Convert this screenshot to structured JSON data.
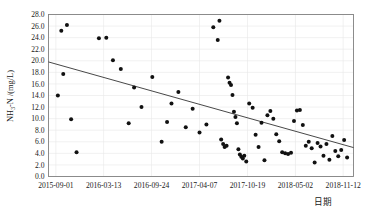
{
  "chart_data": {
    "type": "scatter",
    "title": "",
    "xlabel": "日期",
    "ylabel": "NH3-N /(mg/L)",
    "ylabel_parts": {
      "prefix": "NH",
      "subscript": "3",
      "suffix": "-N /(mg/L)"
    },
    "ylim": [
      0.0,
      28.0
    ],
    "ytick_step": 2.0,
    "yticks": [
      "0.0",
      "2.0",
      "4.0",
      "6.0",
      "8.0",
      "10.0",
      "12.0",
      "14.0",
      "16.0",
      "18.0",
      "20.0",
      "22.0",
      "24.0",
      "26.0",
      "28.0"
    ],
    "ytick_values": [
      0,
      2,
      4,
      6,
      8,
      10,
      12,
      14,
      16,
      18,
      20,
      22,
      24,
      26,
      28
    ],
    "xticks": [
      "2015-09-01",
      "2016-03-13",
      "2016-09-24",
      "2017-04-07",
      "2017-10-19",
      "2018-05-02",
      "2018-11-12"
    ],
    "xtick_days": [
      0,
      194,
      389,
      584,
      779,
      974,
      1168
    ],
    "xlim_days": [
      -30,
      1210
    ],
    "grid": true,
    "grid_color": "#e8e8e8",
    "frame_color": "#808080",
    "marker_color": "#111111",
    "marker_size": 2.0,
    "legend": null,
    "series": [
      {
        "name": "NH3-N measurements",
        "points": [
          {
            "x": 8,
            "y": 14.0
          },
          {
            "x": 22,
            "y": 25.2
          },
          {
            "x": 45,
            "y": 26.2
          },
          {
            "x": 30,
            "y": 17.7
          },
          {
            "x": 62,
            "y": 9.9
          },
          {
            "x": 84,
            "y": 4.2
          },
          {
            "x": 175,
            "y": 23.9
          },
          {
            "x": 205,
            "y": 24.0
          },
          {
            "x": 232,
            "y": 20.1
          },
          {
            "x": 264,
            "y": 18.6
          },
          {
            "x": 296,
            "y": 9.2
          },
          {
            "x": 318,
            "y": 15.4
          },
          {
            "x": 348,
            "y": 12.0
          },
          {
            "x": 392,
            "y": 17.2
          },
          {
            "x": 430,
            "y": 6.0
          },
          {
            "x": 452,
            "y": 9.4
          },
          {
            "x": 470,
            "y": 12.6
          },
          {
            "x": 498,
            "y": 14.6
          },
          {
            "x": 528,
            "y": 8.5
          },
          {
            "x": 556,
            "y": 11.7
          },
          {
            "x": 584,
            "y": 7.6
          },
          {
            "x": 612,
            "y": 9.0
          },
          {
            "x": 640,
            "y": 25.8
          },
          {
            "x": 658,
            "y": 23.6
          },
          {
            "x": 665,
            "y": 26.9
          },
          {
            "x": 672,
            "y": 6.4
          },
          {
            "x": 680,
            "y": 5.6
          },
          {
            "x": 686,
            "y": 5.1
          },
          {
            "x": 694,
            "y": 5.3
          },
          {
            "x": 700,
            "y": 17.1
          },
          {
            "x": 706,
            "y": 16.2
          },
          {
            "x": 712,
            "y": 15.8
          },
          {
            "x": 718,
            "y": 14.1
          },
          {
            "x": 724,
            "y": 11.2
          },
          {
            "x": 730,
            "y": 10.3
          },
          {
            "x": 736,
            "y": 9.2
          },
          {
            "x": 742,
            "y": 4.7
          },
          {
            "x": 748,
            "y": 3.8
          },
          {
            "x": 754,
            "y": 3.4
          },
          {
            "x": 760,
            "y": 3.1
          },
          {
            "x": 766,
            "y": 3.6
          },
          {
            "x": 774,
            "y": 2.6
          },
          {
            "x": 786,
            "y": 12.6
          },
          {
            "x": 800,
            "y": 11.9
          },
          {
            "x": 812,
            "y": 7.2
          },
          {
            "x": 824,
            "y": 5.1
          },
          {
            "x": 836,
            "y": 9.3
          },
          {
            "x": 848,
            "y": 2.8
          },
          {
            "x": 860,
            "y": 10.6
          },
          {
            "x": 872,
            "y": 11.3
          },
          {
            "x": 884,
            "y": 10.0
          },
          {
            "x": 896,
            "y": 7.3
          },
          {
            "x": 908,
            "y": 6.1
          },
          {
            "x": 920,
            "y": 4.2
          },
          {
            "x": 932,
            "y": 4.0
          },
          {
            "x": 944,
            "y": 3.9
          },
          {
            "x": 956,
            "y": 4.1
          },
          {
            "x": 968,
            "y": 9.6
          },
          {
            "x": 980,
            "y": 11.4
          },
          {
            "x": 992,
            "y": 11.5
          },
          {
            "x": 1004,
            "y": 8.9
          },
          {
            "x": 1016,
            "y": 5.3
          },
          {
            "x": 1028,
            "y": 6.0
          },
          {
            "x": 1040,
            "y": 4.9
          },
          {
            "x": 1052,
            "y": 2.4
          },
          {
            "x": 1064,
            "y": 5.8
          },
          {
            "x": 1076,
            "y": 5.2
          },
          {
            "x": 1088,
            "y": 3.6
          },
          {
            "x": 1100,
            "y": 5.6
          },
          {
            "x": 1112,
            "y": 2.9
          },
          {
            "x": 1124,
            "y": 7.0
          },
          {
            "x": 1136,
            "y": 4.4
          },
          {
            "x": 1148,
            "y": 3.5
          },
          {
            "x": 1160,
            "y": 4.6
          },
          {
            "x": 1172,
            "y": 6.3
          },
          {
            "x": 1184,
            "y": 3.3
          }
        ]
      }
    ],
    "trendline": {
      "name": "linear-trend",
      "color": "#333333",
      "x_start_days": -30,
      "y_start": 19.8,
      "x_end_days": 1210,
      "y_end": 5.0
    }
  }
}
